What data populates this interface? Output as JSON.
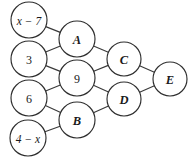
{
  "diagram": {
    "type": "network-graph",
    "canvas": {
      "width": 191,
      "height": 165,
      "background": "#ffffff"
    },
    "style": {
      "node_fill": "#ffffff",
      "node_stroke": "#2e2e2e",
      "edge_stroke": "#3a3a3a",
      "label_color": "#1a1a1a",
      "stroke_width": 1.15
    },
    "nodes": [
      {
        "id": "n1",
        "label": "x − 7",
        "kind": "expr",
        "cx": 29,
        "cy": 20,
        "r": 18,
        "column": 1
      },
      {
        "id": "n2",
        "label": "3",
        "kind": "num",
        "cx": 29,
        "cy": 59,
        "r": 18,
        "column": 1
      },
      {
        "id": "n3",
        "label": "6",
        "kind": "num",
        "cx": 29,
        "cy": 98,
        "r": 18,
        "column": 1
      },
      {
        "id": "n4",
        "label": "4 − x",
        "kind": "expr",
        "cx": 28,
        "cy": 138,
        "r": 18,
        "column": 1
      },
      {
        "id": "nA",
        "label": "A",
        "kind": "var",
        "cx": 77,
        "cy": 39,
        "r": 18,
        "column": 2
      },
      {
        "id": "n9",
        "label": "9",
        "kind": "num",
        "cx": 77,
        "cy": 78,
        "r": 18,
        "column": 2
      },
      {
        "id": "nB",
        "label": "B",
        "kind": "var",
        "cx": 77,
        "cy": 120,
        "r": 18,
        "column": 2
      },
      {
        "id": "nC",
        "label": "C",
        "kind": "var",
        "cx": 124,
        "cy": 59,
        "r": 17,
        "column": 3
      },
      {
        "id": "nD",
        "label": "D",
        "kind": "var",
        "cx": 124,
        "cy": 99,
        "r": 17,
        "column": 3
      },
      {
        "id": "nE",
        "label": "E",
        "kind": "var",
        "cx": 170,
        "cy": 79,
        "r": 17,
        "column": 4
      }
    ],
    "edges": [
      {
        "from": "n1",
        "to": "nA"
      },
      {
        "from": "n2",
        "to": "nA"
      },
      {
        "from": "n2",
        "to": "n9"
      },
      {
        "from": "n3",
        "to": "n9"
      },
      {
        "from": "n3",
        "to": "nB"
      },
      {
        "from": "n4",
        "to": "nB"
      },
      {
        "from": "nA",
        "to": "nC"
      },
      {
        "from": "n9",
        "to": "nC"
      },
      {
        "from": "n9",
        "to": "nD"
      },
      {
        "from": "nB",
        "to": "nD"
      },
      {
        "from": "nC",
        "to": "nE"
      },
      {
        "from": "nD",
        "to": "nE"
      }
    ]
  }
}
